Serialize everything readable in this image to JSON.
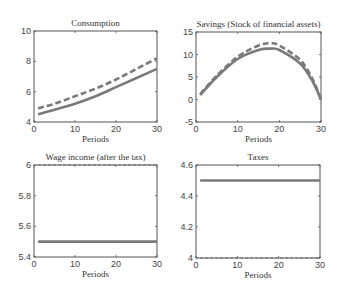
{
  "chart_data": [
    {
      "type": "line",
      "title": "Consumption",
      "xlabel": "Periods",
      "ylabel": "",
      "xlim": [
        0,
        30
      ],
      "ylim": [
        4,
        10
      ],
      "xticks": [
        "0",
        "10",
        "20",
        "30"
      ],
      "yticks": [
        "4",
        "6",
        "8",
        "10"
      ],
      "grid": false,
      "x": [
        1,
        5,
        10,
        15,
        20,
        25,
        30
      ],
      "series": [
        {
          "name": "solid",
          "style": "solid",
          "values": [
            4.5,
            4.8,
            5.2,
            5.7,
            6.3,
            6.9,
            7.5
          ]
        },
        {
          "name": "dashed",
          "style": "dashed",
          "values": [
            4.9,
            5.2,
            5.7,
            6.2,
            6.8,
            7.5,
            8.2
          ]
        }
      ]
    },
    {
      "type": "line",
      "title": "Savings (Stock of financial assets)",
      "xlabel": "Periods",
      "ylabel": "",
      "xlim": [
        0,
        30
      ],
      "ylim": [
        -5,
        15
      ],
      "xticks": [
        "0",
        "10",
        "20",
        "30"
      ],
      "yticks": [
        "-5",
        "0",
        "5",
        "10",
        "15"
      ],
      "grid": false,
      "x": [
        1,
        5,
        10,
        15,
        18,
        20,
        25,
        28,
        30
      ],
      "series": [
        {
          "name": "solid",
          "style": "solid",
          "values": [
            1.0,
            5.0,
            9.0,
            11.0,
            11.3,
            11.0,
            8.0,
            4.0,
            0.0
          ]
        },
        {
          "name": "dashed",
          "style": "dashed",
          "values": [
            1.2,
            5.3,
            9.5,
            12.0,
            12.5,
            12.0,
            8.8,
            4.5,
            0.0
          ]
        }
      ]
    },
    {
      "type": "line",
      "title": "Wage income (after the tax)",
      "xlabel": "Periods",
      "ylabel": "",
      "xlim": [
        0,
        30
      ],
      "ylim": [
        5.4,
        6
      ],
      "xticks": [
        "0",
        "10",
        "20",
        "30"
      ],
      "yticks": [
        "5.4",
        "5.6",
        "5.8",
        "6"
      ],
      "grid": false,
      "x": [
        1,
        30
      ],
      "series": [
        {
          "name": "solid",
          "style": "solid",
          "values": [
            5.5,
            5.5
          ]
        },
        {
          "name": "dashed",
          "style": "dashed",
          "values": [
            6.0,
            6.0
          ]
        }
      ]
    },
    {
      "type": "line",
      "title": "Taxes",
      "xlabel": "Periods",
      "ylabel": "",
      "xlim": [
        0,
        30
      ],
      "ylim": [
        4,
        4.6
      ],
      "xticks": [
        "0",
        "10",
        "20",
        "30"
      ],
      "yticks": [
        "4",
        "4.2",
        "4.4",
        "4.6"
      ],
      "grid": false,
      "x": [
        1,
        30
      ],
      "series": [
        {
          "name": "solid",
          "style": "solid",
          "values": [
            4.5,
            4.5
          ]
        },
        {
          "name": "dashed",
          "style": "dashed",
          "values": [
            4.0,
            4.0
          ]
        }
      ]
    }
  ],
  "panels": [
    {
      "title": "Consumption",
      "xlabel": "Periods"
    },
    {
      "title": "Savings (Stock of financial assets)",
      "xlabel": "Periods"
    },
    {
      "title": "Wage income (after the tax)",
      "xlabel": "Periods"
    },
    {
      "title": "Taxes",
      "xlabel": "Periods"
    }
  ],
  "colors": {
    "line": "#7a7a7a",
    "axis": "#555555"
  }
}
